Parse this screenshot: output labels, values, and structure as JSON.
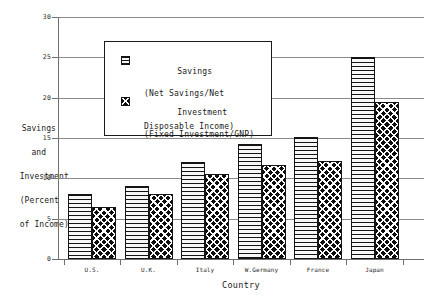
{
  "chart_data": {
    "type": "bar",
    "title": "",
    "xlabel": "Country",
    "ylabel": "Savings and Investment (Percent of Income)",
    "ylim": [
      0,
      30
    ],
    "yticks": [
      0,
      5,
      10,
      15,
      20,
      25,
      30
    ],
    "grid": true,
    "legend_position": "upper-center",
    "categories": [
      "U.S.",
      "U.K.",
      "Italy",
      "W.Germany",
      "France",
      "Japan"
    ],
    "series": [
      {
        "name": "Savings",
        "sublabel": "(Net Savings/Net Disposable Income)",
        "pattern": "horizontal-lines",
        "values": [
          8.0,
          9.0,
          12.0,
          14.2,
          15.1,
          25.0
        ]
      },
      {
        "name": "Investment",
        "sublabel": "(Fixed Investment/GNP)",
        "pattern": "checkerboard",
        "values": [
          6.5,
          8.0,
          10.5,
          11.6,
          12.1,
          19.5
        ]
      }
    ]
  },
  "axis": {
    "y_title_lines": [
      "Savings",
      "and",
      "Investment",
      "(Percent",
      "of Income)"
    ],
    "x_title": "Country",
    "y_tick_labels": [
      "0",
      "5",
      "10",
      "15",
      "20",
      "25",
      "30"
    ]
  },
  "legend": {
    "entries": [
      {
        "label": "Savings",
        "sub_line_1": "(Net Savings/Net",
        "sub_line_2": "Disposable Income)",
        "swatch": "horizontal-lines-swatch"
      },
      {
        "label": "Investment",
        "sub_line_1": "(Fixed Investment/GNP)",
        "sub_line_2": "",
        "swatch": "checkerboard-swatch"
      }
    ]
  },
  "colors": {
    "savings_fill": "#f2f2f2",
    "investment_fill": "#0d0d0d",
    "line": "#141414",
    "grid": "#8a8a8a",
    "text": "#1a1a1a"
  }
}
